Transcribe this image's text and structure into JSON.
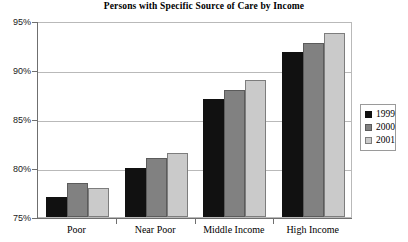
{
  "chart_data": {
    "type": "bar",
    "title": "Persons with Specific Source of Care by Income",
    "xlabel": "",
    "ylabel": "",
    "categories": [
      "Poor",
      "Near Poor",
      "Middle Income",
      "High Income"
    ],
    "series": [
      {
        "name": "1999",
        "color": "#111111",
        "values": [
          77.0,
          80.0,
          87.0,
          91.8
        ]
      },
      {
        "name": "2000",
        "color": "#818181",
        "values": [
          78.5,
          81.0,
          88.0,
          92.8
        ]
      },
      {
        "name": "2001",
        "color": "#cacaca",
        "values": [
          78.0,
          81.5,
          89.0,
          93.8
        ]
      }
    ],
    "ylim": [
      75,
      95
    ],
    "yticks": [
      75,
      80,
      85,
      90,
      95
    ],
    "ytick_labels": [
      "75%",
      "80%",
      "85%",
      "90%",
      "95%"
    ],
    "grid": true,
    "legend_position": "right"
  },
  "legend": {
    "entries": [
      {
        "label": "1999"
      },
      {
        "label": "2000"
      },
      {
        "label": "2001"
      }
    ]
  }
}
